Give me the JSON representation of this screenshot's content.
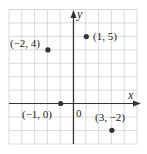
{
  "chart_data": {
    "type": "scatter",
    "title": "",
    "xlabel": "x",
    "ylabel": "y",
    "xlim": [
      -5,
      5
    ],
    "ylim": [
      -3,
      7
    ],
    "grid": true,
    "origin_label": "0",
    "points": [
      {
        "x": -2,
        "y": 4,
        "label": "(−2, 4)"
      },
      {
        "x": 1,
        "y": 5,
        "label": "(1, 5)"
      },
      {
        "x": -1,
        "y": 0,
        "label": "(−1, 0)"
      },
      {
        "x": 3,
        "y": -2,
        "label": "(3, −2)"
      }
    ]
  },
  "colors": {
    "grid": "#d0d0d0",
    "axis": "#333333",
    "point": "#333333"
  }
}
